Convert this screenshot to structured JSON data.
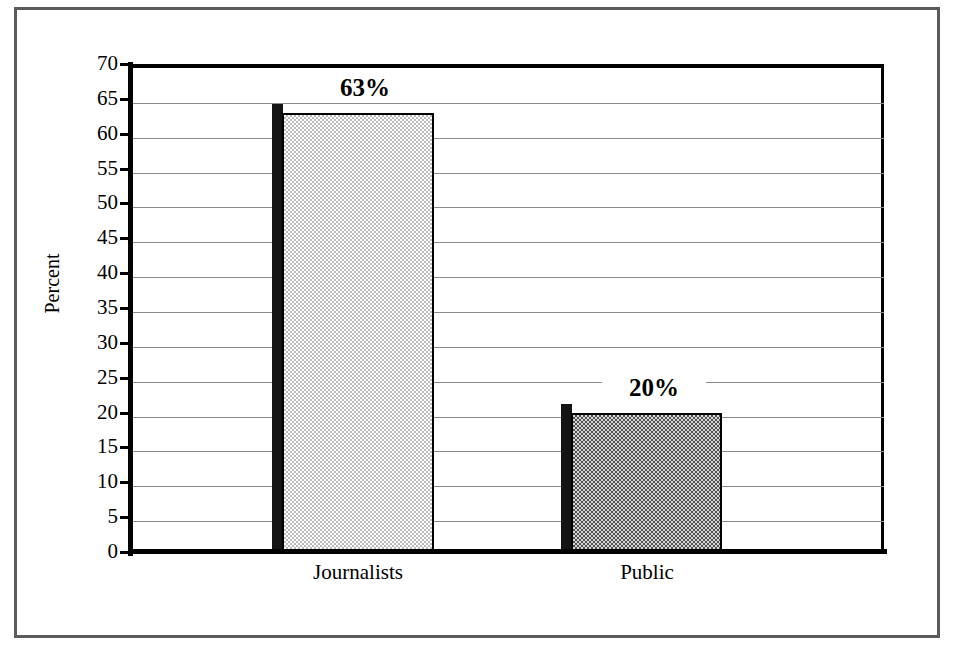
{
  "chart_data": {
    "type": "bar",
    "title": "",
    "subtitle": "",
    "xlabel": "",
    "ylabel": "Percent",
    "categories": [
      "Journalists",
      "Public"
    ],
    "values": [
      63,
      20
    ],
    "value_labels": [
      "63%",
      "20%"
    ],
    "ylim": [
      0,
      70
    ],
    "ytick_step": 5,
    "yticks": [
      70,
      65,
      60,
      55,
      50,
      45,
      40,
      35,
      30,
      25,
      20,
      15,
      10,
      5,
      0
    ],
    "ytick_labels": [
      "70",
      "65",
      "60",
      "55",
      "50",
      "45",
      "40",
      "35",
      "30",
      "25",
      "20",
      "15",
      "10",
      "5",
      "0"
    ],
    "grid": true,
    "grid_axis": "y",
    "legend": false,
    "legend_position": "none",
    "annotations": [
      {
        "text": "63%",
        "series_index": 0,
        "placement": "above-bar"
      },
      {
        "text": "20%",
        "series_index": 1,
        "placement": "above-bar"
      }
    ],
    "series": [
      {
        "name": "Percent",
        "values": [
          63,
          20
        ],
        "bar_styles": [
          "light-checker",
          "dark-checker"
        ]
      }
    ]
  },
  "style": {
    "axis_color": "#000000",
    "grid_color": "#8a8a8a",
    "frame_color": "#5b5b5b",
    "background": "#ffffff",
    "bar_fill_light": "#b9b9b9",
    "bar_fill_dark": "#4f4f4f",
    "bar_shadow": "#141414",
    "text_color": "#000000"
  }
}
